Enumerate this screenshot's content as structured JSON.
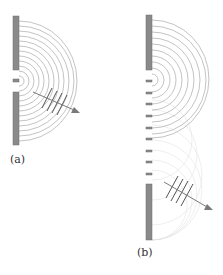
{
  "figure": {
    "panels": [
      {
        "id": "a",
        "label": "(a)",
        "description": "Single narrow slit: circular wavefronts spread from the opening",
        "slit_count": 1,
        "arc_count": 12
      },
      {
        "id": "b",
        "label": "(b)",
        "description": "Many slits (grating): wavelets combine into plane wavefronts traveling in one direction",
        "slit_count": 9,
        "arc_count": 10
      }
    ],
    "colors": {
      "barrier": "#8a8a8a",
      "barrier_edge": "#6e6e6e",
      "arc": "#b4b4b4",
      "faint_arc": "#dcdcdc",
      "wavefront": "#555555",
      "arrow": "#7a7a7a"
    }
  }
}
